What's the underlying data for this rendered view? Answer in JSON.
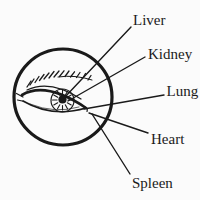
{
  "figure": {
    "labels": [
      {
        "id": "liver",
        "text": "Liver"
      },
      {
        "id": "kidney",
        "text": "Kidney"
      },
      {
        "id": "lung",
        "text": "Lung"
      },
      {
        "id": "heart",
        "text": "Heart"
      },
      {
        "id": "spleen",
        "text": "Spleen"
      }
    ],
    "colors": {
      "ink": "#1a1a1a",
      "background": "#fbfbfb"
    }
  }
}
